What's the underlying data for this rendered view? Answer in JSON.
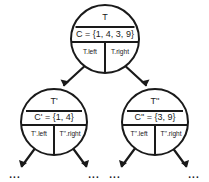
{
  "diagram": {
    "type": "binary-tree-node-structure",
    "background_color": "#ffffff",
    "stroke_color": "#1a1a1a",
    "nodes": {
      "root": {
        "name": "T",
        "set": "C = {1, 4, 3, 9}",
        "left_label": "T.left",
        "right_label": "T.right"
      },
      "left_child": {
        "name": "T'",
        "set": "C' = {1, 4}",
        "left_label": "T'.left",
        "right_label": "T''.right"
      },
      "right_child": {
        "name": "T''",
        "set": "C'' = {3, 9}",
        "left_label": "T''.left",
        "right_label": "T''.right"
      }
    },
    "leaf_ellipses": [
      {
        "text": "..."
      },
      {
        "text": "..."
      },
      {
        "text": "..."
      },
      {
        "text": "..."
      }
    ]
  }
}
